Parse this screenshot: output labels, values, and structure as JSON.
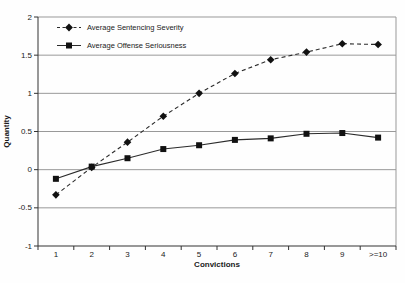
{
  "chart_data": {
    "type": "line",
    "title": "",
    "xlabel": "Convictions",
    "ylabel": "Quantity",
    "categories": [
      "1",
      "2",
      "3",
      "4",
      "5",
      "6",
      "7",
      "8",
      "9",
      ">=10"
    ],
    "ylim": [
      -1,
      2
    ],
    "yticks": [
      -1,
      -0.5,
      0,
      0.5,
      1,
      1.5,
      2
    ],
    "ytick_labels": [
      "-1",
      "-0.5",
      "0",
      "0.5",
      "1",
      "1.5",
      "2"
    ],
    "grid": "horizontal",
    "legend_position": "top-left-inside",
    "series": [
      {
        "name": "Average Sentencing Severity",
        "marker": "diamond",
        "line_style": "dashed",
        "values": [
          -0.33,
          0.03,
          0.36,
          0.7,
          1.0,
          1.26,
          1.44,
          1.54,
          1.65,
          1.64
        ]
      },
      {
        "name": "Average Offense Seriousness",
        "marker": "square",
        "line_style": "solid",
        "values": [
          -0.12,
          0.04,
          0.15,
          0.27,
          0.32,
          0.39,
          0.41,
          0.47,
          0.48,
          0.42
        ]
      }
    ],
    "colors": {
      "series": "#2b2b2b",
      "marker": "#111111",
      "grid": "#999999",
      "axis": "#333333",
      "text": "#1a1a1a"
    }
  }
}
